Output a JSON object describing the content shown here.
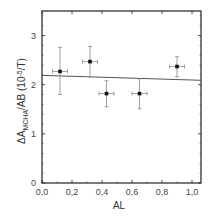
{
  "chart_data": {
    "type": "scatter",
    "title": "",
    "xlabel": "AL",
    "ylabel": "ΔA_MCHA/AB (10^-5/T)",
    "ylabel_parts": {
      "prefix": "ΔA",
      "subscript": "MCHA",
      "suffix": "/AB (10",
      "sup": "-5",
      "tail": "/T)"
    },
    "xlim": [
      0.0,
      1.06
    ],
    "ylim": [
      0,
      3.5
    ],
    "x_ticks": [
      "0,0",
      "0,2",
      "0,4",
      "0,6",
      "0,8",
      "1,0"
    ],
    "x_tick_values": [
      0.0,
      0.2,
      0.4,
      0.6,
      0.8,
      1.0
    ],
    "y_ticks": [
      "0",
      "1",
      "2",
      "3"
    ],
    "y_tick_values": [
      0,
      1,
      2,
      3
    ],
    "grid": false,
    "legend": null,
    "series": [
      {
        "name": "data",
        "marker": "square",
        "points": [
          {
            "x": 0.12,
            "y": 2.27,
            "xerr": 0.05,
            "y_low": 1.8,
            "y_high": 2.76
          },
          {
            "x": 0.32,
            "y": 2.47,
            "xerr": 0.05,
            "y_low": 2.16,
            "y_high": 2.78
          },
          {
            "x": 0.43,
            "y": 1.82,
            "xerr": 0.05,
            "y_low": 1.55,
            "y_high": 2.08
          },
          {
            "x": 0.65,
            "y": 1.82,
            "xerr": 0.05,
            "y_low": 1.51,
            "y_high": 2.12
          },
          {
            "x": 0.9,
            "y": 2.37,
            "xerr": 0.05,
            "y_low": 2.16,
            "y_high": 2.57
          }
        ]
      },
      {
        "name": "linear fit",
        "type": "line",
        "x": [
          0.0,
          1.06
        ],
        "y": [
          2.19,
          2.09
        ]
      }
    ]
  },
  "colors": {
    "axis": "#222222",
    "points": "#111111",
    "errorbars": "#888888",
    "fit_line": "#555555"
  }
}
